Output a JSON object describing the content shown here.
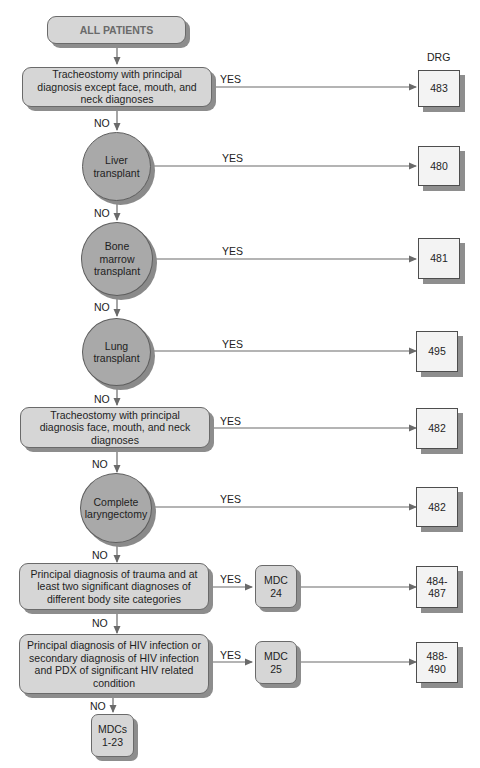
{
  "diagram": {
    "start": "ALL PATIENTS",
    "drg_header": "DRG",
    "yes_label": "YES",
    "no_label": "NO",
    "decisions": [
      {
        "text": "Tracheostomy with principal diagnosis except face, mouth, and neck diagnoses",
        "shape": "rounded-box",
        "outcome": "483"
      },
      {
        "text": "Liver transplant",
        "shape": "circle",
        "outcome": "480"
      },
      {
        "text": "Bone marrow transplant",
        "shape": "circle",
        "outcome": "481"
      },
      {
        "text": "Lung transplant",
        "shape": "circle",
        "outcome": "495"
      },
      {
        "text": "Tracheostomy with principal diagnosis face, mouth, and neck diagnoses",
        "shape": "rounded-box",
        "outcome": "482"
      },
      {
        "text": "Complete laryngectomy",
        "shape": "circle",
        "outcome": "482"
      },
      {
        "text": "Principal diagnosis of trauma and at least two significant diagnoses of different body site categories",
        "shape": "rounded-box",
        "mdc": "MDC 24",
        "outcome": "484-487"
      },
      {
        "text": "Principal diagnosis of HIV infection or secondary diagnosis of HIV infection and PDX of significant HIV related condition",
        "shape": "rounded-box",
        "mdc": "MDC 25",
        "outcome": "488-490"
      }
    ],
    "final": "MDCs 1-23"
  },
  "display": {
    "d0": "Tracheostomy with principal diagnosis except face, mouth, and neck diagnoses",
    "d1a": "Liver",
    "d1b": "transplant",
    "d2a": "Bone",
    "d2b": "marrow",
    "d2c": "transplant",
    "d3a": "Lung",
    "d3b": "transplant",
    "d4": "Tracheostomy with principal diagnosis face, mouth, and neck diagnoses",
    "d5a": "Complete",
    "d5b": "laryngectomy",
    "d6": "Principal diagnosis of trauma and at least two significant diagnoses of different body site categories",
    "d7": "Principal diagnosis of HIV infection or secondary diagnosis of HIV infection and PDX of significant HIV related condition",
    "mdc24a": "MDC",
    "mdc24b": "24",
    "mdc25a": "MDC",
    "mdc25b": "25",
    "fa": "MDCs",
    "fb": "1-23",
    "o0": "483",
    "o1": "480",
    "o2": "481",
    "o3": "495",
    "o4": "482",
    "o5": "482",
    "o6a": "484-",
    "o6b": "487",
    "o7a": "488-",
    "o7b": "490"
  }
}
